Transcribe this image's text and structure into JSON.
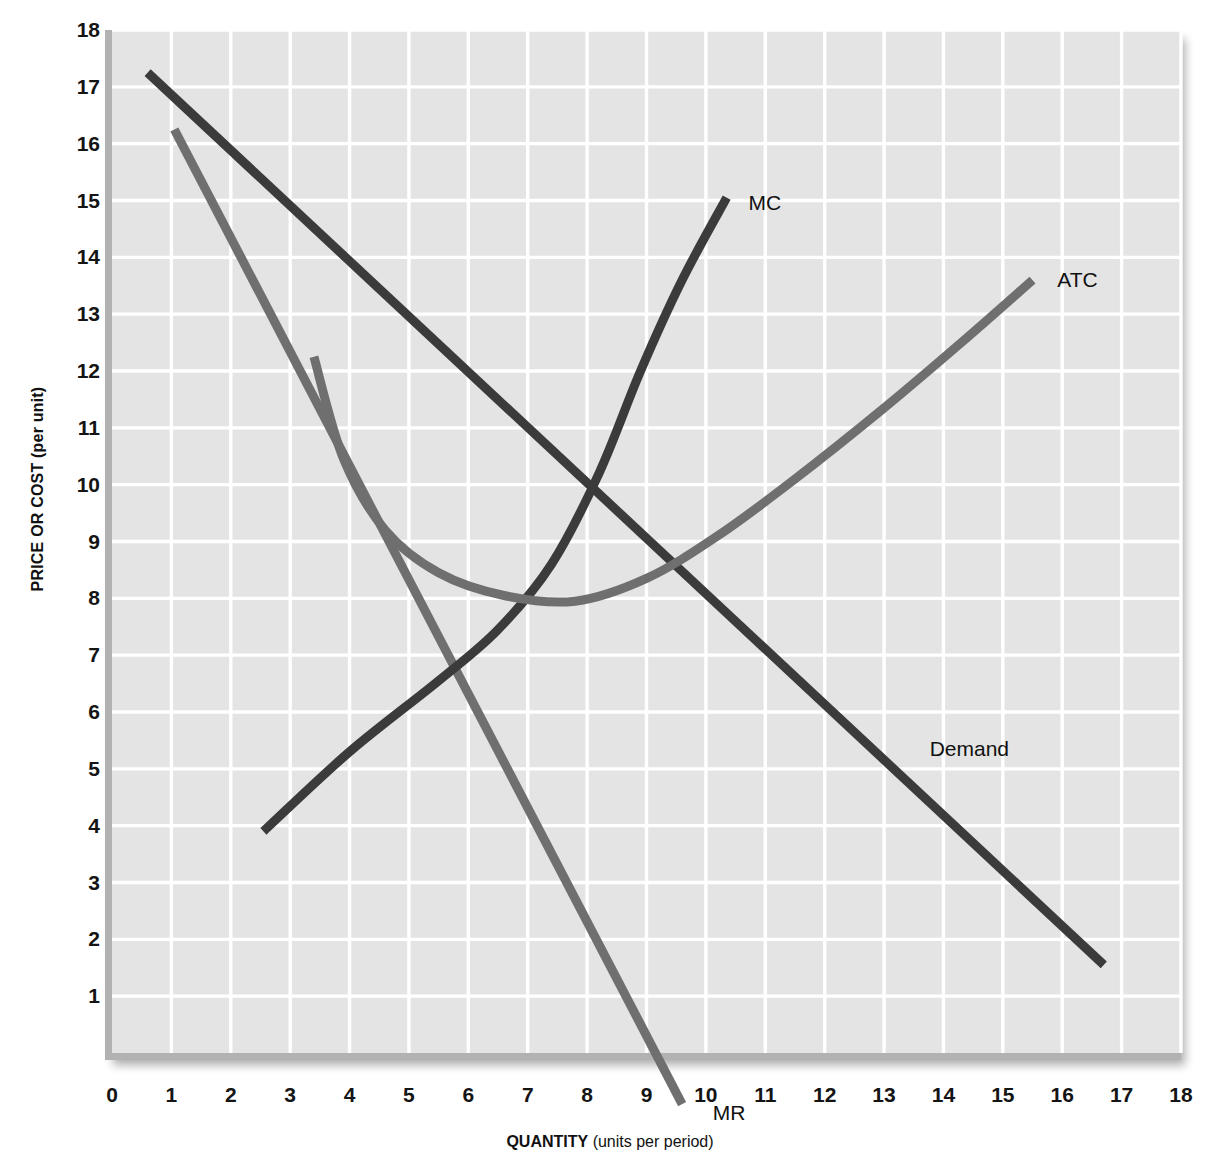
{
  "chart_data": {
    "type": "line",
    "title": "",
    "xlabel_bold": "QUANTITY",
    "xlabel_rest": " (units per period)",
    "ylabel": "PRICE OR COST (per unit)",
    "xlim": [
      0,
      18
    ],
    "ylim": [
      0,
      18
    ],
    "grid": true,
    "grid_color": "#ffffff",
    "plot_background": "#e4e4e4",
    "legend_position": "inline-curve-labels",
    "x_ticks": [
      0,
      1,
      2,
      3,
      4,
      5,
      6,
      7,
      8,
      9,
      10,
      11,
      12,
      13,
      14,
      15,
      16,
      17,
      18
    ],
    "y_ticks": [
      1,
      2,
      3,
      4,
      5,
      6,
      7,
      8,
      9,
      10,
      11,
      12,
      13,
      14,
      15,
      16,
      17,
      18
    ],
    "series": [
      {
        "name": "Demand",
        "label": "Demand",
        "color": "#3b3b3b",
        "kind": "straight-line",
        "points": [
          [
            0.6,
            17.25
          ],
          [
            16.7,
            1.55
          ]
        ],
        "label_at": [
          13.7,
          5.35
        ]
      },
      {
        "name": "MR",
        "label": "MR",
        "color": "#6f6f6f",
        "kind": "straight-line",
        "points": [
          [
            1.05,
            16.25
          ],
          [
            9.6,
            -0.9
          ]
        ],
        "label_at": [
          10.05,
          -1.05
        ]
      },
      {
        "name": "MC",
        "label": "MC",
        "color": "#3b3b3b",
        "kind": "curve",
        "points": [
          [
            2.55,
            3.9
          ],
          [
            4.0,
            5.3
          ],
          [
            5.5,
            6.55
          ],
          [
            6.5,
            7.45
          ],
          [
            7.4,
            8.6
          ],
          [
            8.2,
            10.2
          ],
          [
            8.9,
            12.0
          ],
          [
            9.6,
            13.6
          ],
          [
            10.35,
            15.05
          ]
        ],
        "label_at": [
          10.65,
          14.95
        ]
      },
      {
        "name": "ATC",
        "label": "ATC",
        "color": "#6f6f6f",
        "kind": "curve",
        "points": [
          [
            3.4,
            12.25
          ],
          [
            3.9,
            10.45
          ],
          [
            4.6,
            9.2
          ],
          [
            5.5,
            8.45
          ],
          [
            6.6,
            8.05
          ],
          [
            7.8,
            7.95
          ],
          [
            9.0,
            8.35
          ],
          [
            10.2,
            9.1
          ],
          [
            11.5,
            10.1
          ],
          [
            13.0,
            11.35
          ],
          [
            14.3,
            12.5
          ],
          [
            15.5,
            13.6
          ]
        ],
        "label_at": [
          15.85,
          13.6
        ]
      }
    ],
    "annotations": [
      {
        "name": "atc-minimum",
        "x": 7.8,
        "y": 7.95
      },
      {
        "name": "mc-crosses-atc",
        "x": 9.45,
        "y": 8.6
      },
      {
        "name": "mc-crosses-demand",
        "x": 8.9,
        "y": 9.4
      },
      {
        "name": "mr-crosses-mc",
        "x": 5.85,
        "y": 6.0
      }
    ]
  }
}
